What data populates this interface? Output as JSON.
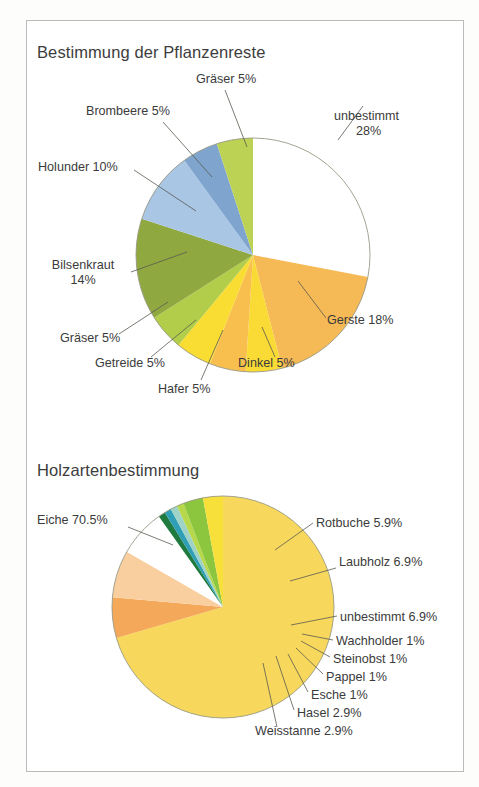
{
  "document": {
    "background": "#ffffff",
    "frame_border_color": "#b9bcbb"
  },
  "charts": [
    {
      "id": "pflanzenreste",
      "title": "Bestimmung der Pflanzenreste"
    },
    {
      "id": "holzarten",
      "title": "Holzartenbestimmung"
    }
  ],
  "labels": {
    "p1": {
      "graeser_top": "Gräser 5%",
      "brombeere": "Brombeere 5%",
      "holunder": "Holunder 10%",
      "bilsenkraut_l1": "Bilsenkraut",
      "bilsenkraut_l2": "14%",
      "graeser_bottom": "Gräser 5%",
      "getreide": "Getreide 5%",
      "hafer": "Hafer 5%",
      "dinkel": "Dinkel 5%",
      "gerste": "Gerste 18%",
      "unbestimmt_l1": "unbestimmt",
      "unbestimmt_l2": "28%"
    },
    "p2": {
      "eiche": "Eiche 70.5%",
      "rotbuche": "Rotbuche 5.9%",
      "laubholz": "Laubholz 6.9%",
      "unbestimmt": "unbestimmt 6.9%",
      "wachholder": "Wachholder 1%",
      "steinobst": "Steinobst 1%",
      "pappel": "Pappel 1%",
      "esche": "Esche 1%",
      "hasel": "Hasel 2.9%",
      "weisstanne": "Weisstanne 2.9%"
    }
  },
  "chart_data": [
    {
      "type": "pie",
      "title": "Bestimmung der Pflanzenreste",
      "units": "percent",
      "legend": "none",
      "labels_inline": true,
      "start_angle_deg": -90,
      "direction": "clockwise",
      "center": [
        253,
        255
      ],
      "radius": 117,
      "categories": [
        "unbestimmt",
        "Gerste",
        "Dinkel",
        "Hafer",
        "Getreide",
        "Gräser",
        "Bilsenkraut",
        "Holunder",
        "Brombeere",
        "Gräser"
      ],
      "values": [
        28,
        18,
        5,
        5,
        5,
        5,
        14,
        10,
        5,
        5
      ],
      "colors": [
        "#ffffff",
        "#f5b955",
        "#fada35",
        "#f9bf4e",
        "#f9dd33",
        "#b2cd4a",
        "#8fa840",
        "#a9c6e5",
        "#7fa5cf",
        "#bcd255"
      ],
      "slice_labels": [
        "unbestimmt 28%",
        "Gerste 18%",
        "Dinkel 5%",
        "Hafer 5%",
        "Getreide 5%",
        "Gräser 5%",
        "Bilsenkraut 14%",
        "Holunder 10%",
        "Brombeere 5%",
        "Gräser 5%"
      ],
      "total": 100
    },
    {
      "type": "pie",
      "title": "Holzartenbestimmung",
      "units": "percent",
      "legend": "none",
      "labels_inline": true,
      "start_angle_deg": -90,
      "direction": "clockwise",
      "center": [
        223,
        607
      ],
      "radius": 111,
      "categories": [
        "Eiche",
        "Rotbuche",
        "Laubholz",
        "unbestimmt",
        "Wachholder",
        "Steinobst",
        "Pappel",
        "Esche",
        "Hasel",
        "Weisstanne"
      ],
      "values": [
        70.5,
        5.9,
        6.9,
        6.9,
        1,
        1,
        1,
        1,
        2.9,
        2.9
      ],
      "colors": [
        "#f7d85c",
        "#f3a košt"
      ],
      "slice_colors": [
        "#f7d85c",
        "#f4a85a",
        "#f9cfa0",
        "#ffffff",
        "#1f7a3f",
        "#2f9fb5",
        "#9fd3c8",
        "#b6d84a",
        "#8cc63f",
        "#f7e03a"
      ],
      "slice_labels": [
        "Eiche 70.5%",
        "Rotbuche 5.9%",
        "Laubholz 6.9%",
        "unbestimmt 6.9%",
        "Wachholder 1%",
        "Steinobst 1%",
        "Pappel 1%",
        "Esche 1%",
        "Hasel 2.9%",
        "Weisstanne 2.9%"
      ],
      "total": 100
    }
  ]
}
